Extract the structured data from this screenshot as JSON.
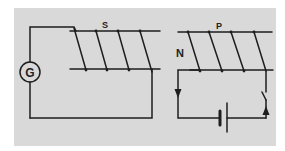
{
  "diagram": {
    "type": "electromagnetic induction circuit",
    "background_color": "#d9d9d9",
    "line_color": "#1e1e1e",
    "left_circuit": {
      "meter_label": "G",
      "meter_icon": "galvanometer-icon",
      "coil_label": "S",
      "coil_name": "secondary-coil"
    },
    "right_circuit": {
      "coil_label": "P",
      "coil_name": "primary-coil",
      "pole_label": "N",
      "components": [
        "battery",
        "switch",
        "current-direction-arrows"
      ]
    }
  }
}
